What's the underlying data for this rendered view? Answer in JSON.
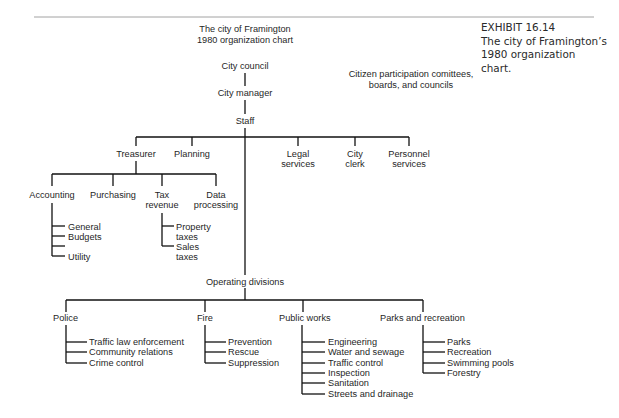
{
  "chart_title": {
    "line1": "The city of Framington",
    "line2": "1980 organization chart"
  },
  "caption": {
    "label": "EXHIBIT 16.14",
    "line1": "The city of Framington’s",
    "line2": "1980 organization",
    "line3": "chart."
  },
  "citizen_participation": {
    "line1": "Citizen participation comittees,",
    "line2": "boards, and councils"
  },
  "chain": {
    "council": "City council",
    "manager": "City manager",
    "staff": "Staff"
  },
  "staff_units": {
    "treasurer": "Treasurer",
    "planning": "Planning",
    "legal": [
      "Legal",
      "services"
    ],
    "clerk": [
      "City",
      "clerk"
    ],
    "personnel": [
      "Personnel",
      "services"
    ]
  },
  "treasurer_units": {
    "accounting": "Accounting",
    "purchasing": "Purchasing",
    "tax_revenue": [
      "Tax",
      "revenue"
    ],
    "data_processing": [
      "Data",
      "processing"
    ]
  },
  "accounting_items": [
    "General",
    "Budgets",
    "",
    "Utility"
  ],
  "tax_items": {
    "property": [
      "Property",
      "taxes"
    ],
    "sales": [
      "Sales",
      "taxes"
    ]
  },
  "operating": {
    "label": "Operating divisions",
    "divisions": [
      {
        "name": "Police",
        "items": [
          "Traffic law enforcement",
          "Community relations",
          "Crime control"
        ]
      },
      {
        "name": "Fire",
        "items": [
          "Prevention",
          "Rescue",
          "Suppression"
        ]
      },
      {
        "name": "Public works",
        "items": [
          "Engineering",
          "Water and sewage",
          "Traffic control",
          "Inspection",
          "Sanitation",
          "Streets and drainage"
        ]
      },
      {
        "name": "Parks and recreation",
        "items": [
          "Parks",
          "Recreation",
          "Swimming pools",
          "Forestry"
        ]
      }
    ]
  }
}
